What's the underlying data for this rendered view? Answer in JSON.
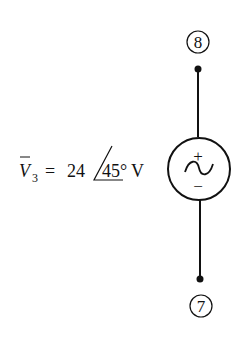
{
  "diagram": {
    "type": "circuit",
    "nodes": [
      {
        "id": "node-8",
        "label": "8"
      },
      {
        "id": "node-7",
        "label": "7"
      }
    ],
    "source": {
      "kind": "ac-voltage-source",
      "plus_label": "+",
      "minus_label": "−",
      "symbol": "~"
    },
    "equation": {
      "variable": "V",
      "subscript": "3",
      "equals": "=",
      "magnitude": "24",
      "angle": "45°",
      "unit": "V"
    }
  }
}
